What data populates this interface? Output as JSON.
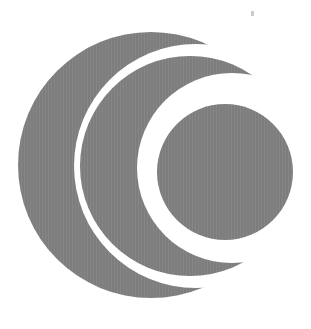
{
  "image": {
    "kind": "logo-emblem",
    "title": "Concentric crescent logo",
    "description": "Grey disk with two white crescent gaps forming nested C arcs around a solid inner disk",
    "width": 311,
    "height": 329,
    "background_color": "#ffffff"
  },
  "palette": {
    "mark_gray": "#7d7d7d",
    "mark_gray_shade": "#868686",
    "gap_white": "#ffffff",
    "speck_gray": "#b9b9b9"
  },
  "shapes": {
    "outer_disk": {
      "name": "outer-disk",
      "cx": 151,
      "cy": 165,
      "r": 133,
      "fill": "#7d7d7d"
    },
    "gap_outer": {
      "name": "outer-crescent-gap",
      "cx": 196,
      "cy": 166,
      "r": 122,
      "fill": "#ffffff"
    },
    "ring_middle": {
      "name": "middle-arc",
      "cx": 190,
      "cy": 166,
      "r": 110,
      "fill": "#7d7d7d"
    },
    "gap_inner": {
      "name": "inner-crescent-gap",
      "cx": 232,
      "cy": 168,
      "r": 95,
      "fill": "#ffffff"
    },
    "inner_disk": {
      "name": "inner-disk",
      "cx": 225,
      "cy": 172,
      "r": 68,
      "fill": "#7d7d7d"
    },
    "speck": {
      "name": "dust-speck",
      "x": 251,
      "y": 11
    }
  }
}
